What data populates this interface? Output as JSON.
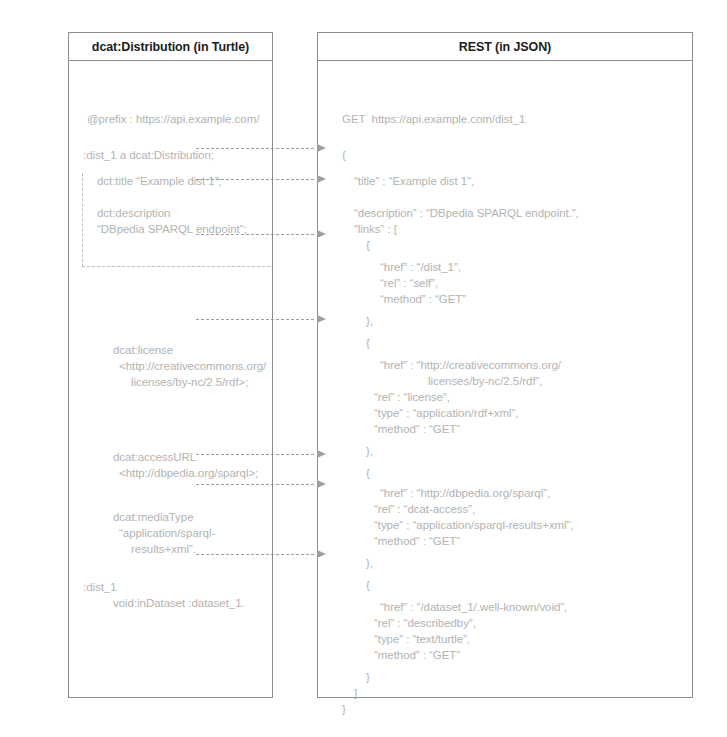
{
  "left_panel": {
    "header": "dcat:Distribution (in Turtle)",
    "lines": [
      {
        "text": "@prefix : https://api.example.com/",
        "x": 18,
        "y": 52
      },
      {
        "text": ":dist_1 a dcat:Distribution;",
        "x": 14,
        "y": 88
      },
      {
        "text": "dct:title “Example dist 1”;",
        "x": 28,
        "y": 114
      },
      {
        "text": "dct:description",
        "x": 28,
        "y": 146
      },
      {
        "text": "“DBpedia SPARQL endpoint”;",
        "x": 28,
        "y": 162
      },
      {
        "text": "dcat:license",
        "x": 44,
        "y": 283
      },
      {
        "text": "<http://creativecommons.org/",
        "x": 50,
        "y": 299
      },
      {
        "text": "licenses/by-nc/2.5/rdf>;",
        "x": 62,
        "y": 315
      },
      {
        "text": "dcat:accessURL",
        "x": 44,
        "y": 390
      },
      {
        "text": "<http://dbpedia.org/sparql>;",
        "x": 50,
        "y": 406
      },
      {
        "text": "dcat:mediaType",
        "x": 44,
        "y": 450
      },
      {
        "text": "“application/sparql-",
        "x": 50,
        "y": 466
      },
      {
        "text": "results+xml”.",
        "x": 62,
        "y": 482
      },
      {
        "text": ":dist_1",
        "x": 14,
        "y": 520
      },
      {
        "text": "void:inDataset :dataset_1.",
        "x": 44,
        "y": 536
      }
    ]
  },
  "right_panel": {
    "header": "REST (in JSON)",
    "lines": [
      {
        "text": "GET  https://api.example.com/dist_1",
        "x": 24,
        "y": 52
      },
      {
        "text": "{",
        "x": 24,
        "y": 88
      },
      {
        "text": "“title” : “Example dist 1”,",
        "x": 36,
        "y": 114
      },
      {
        "text": "“description” : “DBpedia SPARQL endpoint.”,",
        "x": 36,
        "y": 146
      },
      {
        "text": "“links” : [",
        "x": 36,
        "y": 162
      },
      {
        "text": "{",
        "x": 48,
        "y": 178
      },
      {
        "text": "“href” : “/dist_1”,",
        "x": 62,
        "y": 200
      },
      {
        "text": "“rel” : “self”,",
        "x": 62,
        "y": 216
      },
      {
        "text": "“method” : “GET”",
        "x": 62,
        "y": 232
      },
      {
        "text": "},",
        "x": 48,
        "y": 254
      },
      {
        "text": "{",
        "x": 48,
        "y": 276
      },
      {
        "text": "“href” : “http://creativecommons.org/",
        "x": 62,
        "y": 298
      },
      {
        "text": "licenses/by-nc/2.5/rdf”,",
        "x": 110,
        "y": 314
      },
      {
        "text": "“rel” : “license”,",
        "x": 56,
        "y": 330
      },
      {
        "text": "“type” : “application/rdf+xml”,",
        "x": 56,
        "y": 346
      },
      {
        "text": "“method” : “GET”",
        "x": 56,
        "y": 362
      },
      {
        "text": "},",
        "x": 48,
        "y": 384
      },
      {
        "text": "{",
        "x": 48,
        "y": 406
      },
      {
        "text": "“href” : “http://dbpedia.org/sparql”,",
        "x": 62,
        "y": 426
      },
      {
        "text": "“rel” : “dcat-access”,",
        "x": 56,
        "y": 442
      },
      {
        "text": "“type” : “application/sparql-results+xml”,",
        "x": 56,
        "y": 458
      },
      {
        "text": "“method” : “GET”",
        "x": 56,
        "y": 474
      },
      {
        "text": "},",
        "x": 48,
        "y": 496
      },
      {
        "text": "{",
        "x": 48,
        "y": 518
      },
      {
        "text": "“href” : “/dataset_1/.well-known/void”,",
        "x": 62,
        "y": 540
      },
      {
        "text": "“rel” : “describedby”,",
        "x": 56,
        "y": 556
      },
      {
        "text": "“type” : “text/turtle”,",
        "x": 56,
        "y": 572
      },
      {
        "text": "“method” : “GET”",
        "x": 56,
        "y": 588
      },
      {
        "text": "}",
        "x": 48,
        "y": 610
      },
      {
        "text": "]",
        "x": 36,
        "y": 626
      },
      {
        "text": "}",
        "x": 24,
        "y": 642
      }
    ]
  },
  "mappings": [
    {
      "name": "title-mapping",
      "y": 148
    },
    {
      "name": "description-mapping",
      "y": 179
    },
    {
      "name": "group-mapping",
      "y": 234
    },
    {
      "name": "license-mapping",
      "y": 319
    },
    {
      "name": "access-url-mapping",
      "y": 454
    },
    {
      "name": "media-type-mapping",
      "y": 484
    },
    {
      "name": "in-dataset-mapping",
      "y": 554
    }
  ],
  "colors": {
    "border": "#8c8c8c",
    "header_text": "#1d1d1d",
    "body_text": "#b3b3b3",
    "arrow": "#9e9e9e"
  }
}
